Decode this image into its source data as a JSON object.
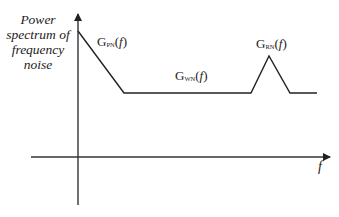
{
  "diagram": {
    "y_axis_label_lines": [
      "Power",
      "spectrum of",
      "frequency",
      "noise"
    ],
    "x_axis_label": "f",
    "curve_labels": [
      {
        "id": "pn",
        "main": "G",
        "sub": "PN",
        "arg": "f",
        "open": "(",
        "close": ")"
      },
      {
        "id": "wn",
        "main": "G",
        "sub": "WN",
        "arg": "f",
        "open": "(",
        "close": ")"
      },
      {
        "id": "rn",
        "main": "G",
        "sub": "RN",
        "arg": "f",
        "open": "(",
        "close": ")"
      }
    ],
    "curve_points": [
      [
        78,
        31
      ],
      [
        124,
        93
      ],
      [
        251,
        93
      ],
      [
        269,
        56
      ],
      [
        290,
        93
      ],
      [
        317,
        93
      ]
    ],
    "line_color": "#222222"
  }
}
